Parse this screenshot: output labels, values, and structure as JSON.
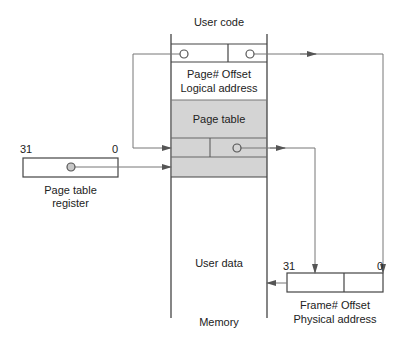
{
  "diagram": {
    "memory": {
      "top_label": "User code",
      "logical_address": {
        "field1": "Page#",
        "field2": "Offset",
        "line1": "Page# Offset",
        "line2": "Logical address"
      },
      "page_table_label": "Page table",
      "user_data_label": "User data",
      "bottom_label": "Memory"
    },
    "page_table_register": {
      "bit_high": "31",
      "bit_low": "0",
      "line1": "Page table",
      "line2": "register"
    },
    "physical_address": {
      "bit_high": "31",
      "bit_low": "0",
      "line1": "Frame# Offset",
      "line2": "Physical address"
    },
    "colors": {
      "line": "#555555",
      "page_table_fill": "#d4d4d4",
      "node_fill": "#c8c8c8"
    }
  }
}
